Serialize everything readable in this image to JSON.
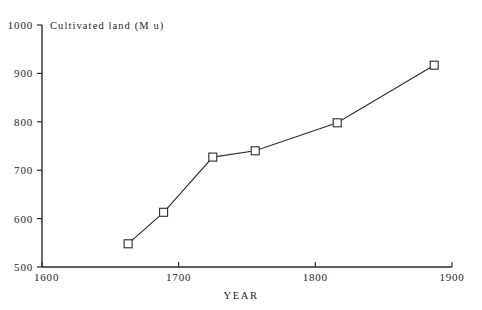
{
  "chart_data": {
    "type": "line",
    "title": "Cultivated land (M u)",
    "xlabel": "YEAR",
    "ylabel": "Cultivated land (M u)",
    "xlim": [
      1600,
      1900
    ],
    "ylim": [
      500,
      1000
    ],
    "grid": false,
    "legend": null,
    "x_ticks": [
      1600,
      1700,
      1800,
      1900
    ],
    "x_tick_labels": [
      "1600",
      "1700",
      "1800",
      "1900"
    ],
    "y_ticks": [
      500,
      600,
      700,
      800,
      900,
      1000
    ],
    "y_tick_labels": [
      "500",
      "600",
      "700",
      "800",
      "900",
      "1000"
    ],
    "marker": "open-square",
    "series": [
      {
        "name": "Cultivated land",
        "x": [
          1663,
          1689,
          1725,
          1756,
          1816,
          1887
        ],
        "values": [
          548,
          613,
          727,
          740,
          798,
          917
        ]
      }
    ],
    "points": [
      {
        "x": 1663,
        "y": 548
      },
      {
        "x": 1689,
        "y": 613
      },
      {
        "x": 1725,
        "y": 727
      },
      {
        "x": 1756,
        "y": 740
      },
      {
        "x": 1816,
        "y": 798
      },
      {
        "x": 1887,
        "y": 917
      }
    ],
    "colors": {
      "line": "#2b2b2b",
      "marker_fill": "#ffffff",
      "marker_stroke": "#2b2b2b",
      "axis": "#2b2b2b",
      "background": "#ffffff",
      "text": "#262626"
    }
  }
}
